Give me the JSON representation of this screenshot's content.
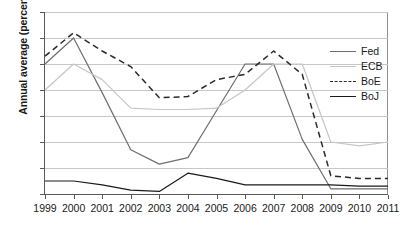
{
  "chart_data": {
    "type": "line",
    "title": "",
    "xlabel": "",
    "ylabel": "Annual average (percent)",
    "x": [
      1999,
      2000,
      2001,
      2002,
      2003,
      2004,
      2005,
      2006,
      2007,
      2008,
      2009,
      2010,
      2011
    ],
    "xtick_labels": [
      "1999",
      "2000",
      "2001",
      "2002",
      "2003",
      "2004",
      "2005",
      "2006",
      "2007",
      "2008",
      "2009",
      "2010",
      "2011"
    ],
    "ytick_labels": [
      "0",
      "1",
      "2",
      "3",
      "4",
      "5",
      "6",
      "7"
    ],
    "yticks": [
      0,
      1,
      2,
      3,
      4,
      5,
      6,
      7
    ],
    "ylim": [
      0,
      7
    ],
    "xlim": [
      1999,
      2011
    ],
    "grid": true,
    "grid_axis": "y",
    "legend_position": "right",
    "series": [
      {
        "name": "Fed",
        "color": "#6e6e6e",
        "style": "solid",
        "values": [
          5.0,
          6.0,
          3.9,
          1.7,
          1.15,
          1.4,
          3.2,
          5.0,
          5.0,
          2.1,
          0.2,
          0.2,
          0.2
        ]
      },
      {
        "name": "ECB",
        "color": "#c6c6c6",
        "style": "solid",
        "values": [
          4.0,
          5.0,
          4.4,
          3.3,
          3.25,
          3.25,
          3.3,
          4.0,
          5.0,
          5.0,
          2.0,
          1.85,
          2.0
        ]
      },
      {
        "name": "BoE",
        "color": "#2a2a2a",
        "style": "dashed",
        "values": [
          5.3,
          6.2,
          5.5,
          4.9,
          3.7,
          3.75,
          4.4,
          4.6,
          5.5,
          4.6,
          0.7,
          0.6,
          0.6
        ]
      },
      {
        "name": "BoJ",
        "color": "#1a1a1a",
        "style": "solid",
        "values": [
          0.5,
          0.5,
          0.35,
          0.15,
          0.1,
          0.8,
          0.6,
          0.35,
          0.35,
          0.35,
          0.35,
          0.3,
          0.3
        ]
      }
    ]
  },
  "legend": {
    "items": [
      {
        "label": "Fed"
      },
      {
        "label": "ECB"
      },
      {
        "label": "BoE"
      },
      {
        "label": "BoJ"
      }
    ]
  }
}
